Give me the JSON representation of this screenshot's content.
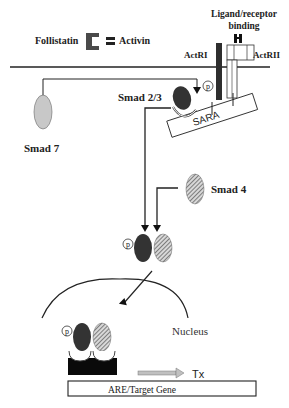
{
  "diagram": {
    "labels": {
      "follistatin": "Follistatin",
      "activin": "Activin",
      "ligand_binding_line1": "Ligand/receptor",
      "ligand_binding_line2": "binding",
      "actr1": "ActRI",
      "actr2": "ActRII",
      "smad23": "Smad 2/3",
      "smad7": "Smad 7",
      "smad4": "Smad 4",
      "sara": "SARA",
      "nucleus": "Nucleus",
      "tx": "Tx",
      "target_gene": "ARE/Target Gene",
      "phospho": "p"
    },
    "colors": {
      "line": "#1a1a1a",
      "smad23_fill": "#3a3a3a",
      "smad7_fill": "#c8c8c8",
      "smad4_hatch": "#6a6a6a",
      "receptor1_fill": "#2e2e2e",
      "follistatin_fill": "#4a4a4a",
      "tx_arrow_fill": "#c0c0c0",
      "dna_block_fill": "#0a0a0a"
    },
    "nodes": [
      {
        "id": "follistatin",
        "label": "Follistatin"
      },
      {
        "id": "activin",
        "label": "Activin"
      },
      {
        "id": "actr1",
        "label": "ActRI"
      },
      {
        "id": "actr2",
        "label": "ActRII"
      },
      {
        "id": "smad23",
        "label": "Smad 2/3"
      },
      {
        "id": "sara",
        "label": "SARA"
      },
      {
        "id": "smad7",
        "label": "Smad 7"
      },
      {
        "id": "smad4",
        "label": "Smad 4"
      },
      {
        "id": "complex",
        "label": "p-Smad2/3 + Smad4"
      },
      {
        "id": "nucleus",
        "label": "Nucleus"
      },
      {
        "id": "target_gene",
        "label": "ARE/Target Gene"
      }
    ],
    "edges": [
      {
        "from": "smad7",
        "to": "smad23",
        "type": "inhibit-arrow"
      },
      {
        "from": "smad23",
        "to": "complex",
        "type": "arrow"
      },
      {
        "from": "smad4",
        "to": "complex",
        "type": "arrow"
      },
      {
        "from": "complex",
        "to": "nucleus",
        "type": "arrow"
      },
      {
        "from": "target_gene",
        "to": "tx",
        "type": "arrow"
      }
    ]
  }
}
